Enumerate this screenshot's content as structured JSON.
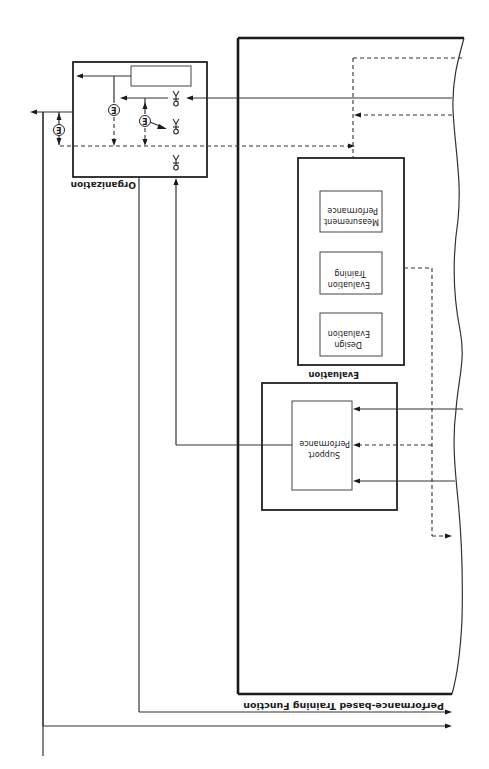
{
  "diagram": {
    "orientation": "rotated 180 degrees",
    "frame": {
      "label": "Performance-based Training Function"
    },
    "organization": {
      "label": "Organization",
      "symbols": [
        "Y-junction",
        "Y-junction",
        "Y-junction"
      ],
      "markers": [
        "E",
        "E",
        "E"
      ]
    },
    "evaluation": {
      "label": "Evaluation",
      "components": [
        {
          "line1": "Performance",
          "line2": "Measurement"
        },
        {
          "line1": "Training",
          "line2": "Evaluation"
        },
        {
          "line1": "Evaluation",
          "line2": "Design"
        }
      ]
    },
    "performance_support": {
      "line1": "Performance",
      "line2": "Support"
    },
    "colors": {
      "line": "#333333",
      "background": "#ffffff"
    }
  }
}
